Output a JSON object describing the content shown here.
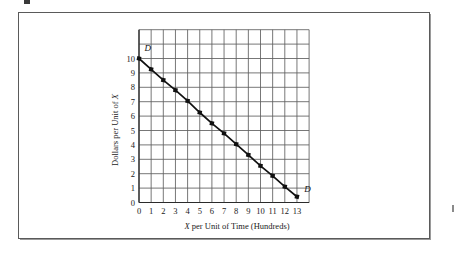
{
  "figure": {
    "kind": "economics-demand-curve-figure",
    "background_color": "#ffffff",
    "frame_color": "#5a5a5a"
  },
  "chart_data": {
    "type": "line",
    "title": "",
    "subtitle": "",
    "xlabel_parts": {
      "variable": "X",
      "rest": " per Unit of Time (Hundreds)"
    },
    "xlabel": "X per Unit of Time (Hundreds)",
    "ylabel_parts": {
      "lead": "Dollars per Unit of ",
      "variable": "X"
    },
    "ylabel": "Dollars per Unit of X",
    "xlim": [
      0,
      14
    ],
    "ylim": [
      0,
      12
    ],
    "xticks": [
      0,
      1,
      2,
      3,
      4,
      5,
      6,
      7,
      8,
      9,
      10,
      11,
      12,
      13
    ],
    "xtick_labels": [
      "0",
      "1",
      "2",
      "3",
      "4",
      "5",
      "6",
      "7",
      "8",
      "9",
      "10",
      "11",
      "12",
      "13"
    ],
    "yticks": [
      0,
      1,
      2,
      3,
      4,
      5,
      6,
      7,
      8,
      9,
      10
    ],
    "ytick_labels": [
      "0",
      "1",
      "2",
      "3",
      "4",
      "5",
      "6",
      "7",
      "8",
      "9",
      "10"
    ],
    "grid": true,
    "grid_x_lines": [
      0,
      1,
      2,
      3,
      4,
      5,
      6,
      7,
      8,
      9,
      10,
      11,
      12,
      13,
      14
    ],
    "grid_y_lines": [
      0,
      1,
      2,
      3,
      4,
      5,
      6,
      7,
      8,
      9,
      10,
      11,
      12
    ],
    "grid_color": "#5f5f5f",
    "legend": "none",
    "series": [
      {
        "name": "D",
        "label_start": "D",
        "label_end": "D",
        "color": "#111111",
        "marker": "square",
        "x": [
          0,
          1,
          2,
          3,
          4,
          5,
          6,
          7,
          8,
          9,
          10,
          11,
          12,
          13
        ],
        "y": [
          10.0,
          9.25,
          8.5,
          7.8,
          7.05,
          6.25,
          5.5,
          4.8,
          4.05,
          3.3,
          2.55,
          1.85,
          1.1,
          0.4
        ]
      }
    ],
    "annotations": [
      {
        "text": "D",
        "x": 0.45,
        "y": 10.55,
        "style": "italic"
      },
      {
        "text": "D",
        "x": 13.6,
        "y": 0.75,
        "style": "italic"
      }
    ]
  }
}
